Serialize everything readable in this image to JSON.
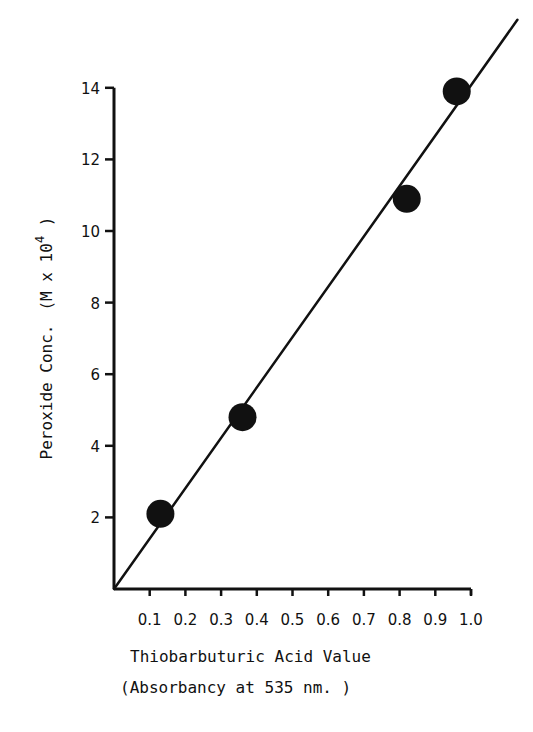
{
  "chart_data": {
    "type": "scatter",
    "title": "",
    "xlabel": "Thiobarbuturic Acid Value",
    "xlabel_sub": "(Absorbancy at 535 nm. )",
    "ylabel": "Peroxide Conc.",
    "ylabel_units": "(M x 10",
    "ylabel_exp": "4",
    "ylabel_close": " )",
    "xlim": [
      0,
      1.0
    ],
    "ylim": [
      0,
      14
    ],
    "x_ticks": [
      "0.1",
      "0.2",
      "0.3",
      "0.4",
      "0.5",
      "0.6",
      "0.7",
      "0.8",
      "0.9",
      "1.0"
    ],
    "x_tick_values": [
      0.1,
      0.2,
      0.3,
      0.4,
      0.5,
      0.6,
      0.7,
      0.8,
      0.9,
      1.0
    ],
    "y_ticks": [
      "2",
      "4",
      "6",
      "8",
      "10",
      "12",
      "14"
    ],
    "y_tick_values": [
      2,
      4,
      6,
      8,
      10,
      12,
      14
    ],
    "grid": false,
    "legend": null,
    "series": [
      {
        "name": "data points",
        "x": [
          0.13,
          0.36,
          0.82,
          0.96
        ],
        "y": [
          2.1,
          4.8,
          10.9,
          13.9
        ]
      }
    ],
    "fit_line": {
      "x": [
        0.0,
        1.13
      ],
      "y": [
        0.0,
        15.9
      ]
    },
    "colors": {
      "ink": "#111111",
      "background": "#ffffff"
    }
  }
}
